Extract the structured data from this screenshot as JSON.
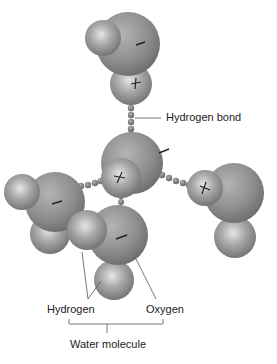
{
  "diagram": {
    "labels": {
      "hydrogen_bond": "Hydrogen bond",
      "hydrogen": "Hydrogen",
      "oxygen": "Oxygen",
      "water_molecule": "Water molecule"
    },
    "charges": {
      "oxygen": "−",
      "hydrogen": "+"
    },
    "colors": {
      "oxygen_sphere": "#8a8a8a",
      "hydrogen_sphere": "#9a9a9a",
      "bond_dots": "#777777",
      "lines": "#555555",
      "text": "#222222"
    },
    "molecules": [
      {
        "id": "top",
        "role": "water-molecule"
      },
      {
        "id": "center",
        "role": "water-molecule"
      },
      {
        "id": "left",
        "role": "water-molecule"
      },
      {
        "id": "right",
        "role": "water-molecule"
      },
      {
        "id": "bottom",
        "role": "water-molecule"
      }
    ]
  }
}
